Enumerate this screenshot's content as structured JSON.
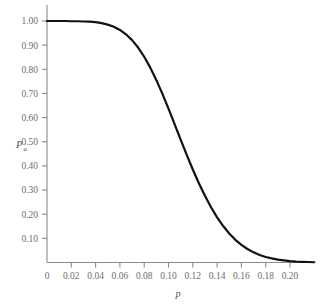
{
  "chart_data": {
    "type": "line",
    "title": "",
    "subtitle": "",
    "xlabel": "p",
    "ylabel": "Pa",
    "ylabel_main": "P",
    "ylabel_sub": "a",
    "xlim": [
      0,
      0.22
    ],
    "ylim": [
      0,
      1.0
    ],
    "grid": false,
    "legend": null,
    "x_ticks": [
      0,
      0.02,
      0.04,
      0.06,
      0.08,
      0.1,
      0.12,
      0.14,
      0.16,
      0.18,
      0.2
    ],
    "x_tick_labels": [
      "0",
      "0.02",
      "0.04",
      "0.06",
      "0.08",
      "0.10",
      "0.12",
      "0.14",
      "0.16",
      "0.18",
      "0.20"
    ],
    "y_ticks": [
      0.1,
      0.2,
      0.3,
      0.4,
      0.5,
      0.6,
      0.7,
      0.8,
      0.9,
      1.0
    ],
    "y_tick_labels": [
      "0.10",
      "0.20",
      "0.30",
      "0.40",
      "0.50",
      "0.60",
      "0.70",
      "0.80",
      "0.90",
      "1.00"
    ],
    "series": [
      {
        "name": "Probability of acceptance",
        "color": "#111111",
        "x": [
          0.0,
          0.005,
          0.01,
          0.015,
          0.02,
          0.025,
          0.03,
          0.035,
          0.04,
          0.045,
          0.05,
          0.055,
          0.06,
          0.065,
          0.07,
          0.075,
          0.08,
          0.085,
          0.09,
          0.095,
          0.1,
          0.105,
          0.11,
          0.115,
          0.12,
          0.125,
          0.13,
          0.135,
          0.14,
          0.145,
          0.15,
          0.155,
          0.16,
          0.165,
          0.17,
          0.175,
          0.18,
          0.185,
          0.19,
          0.195,
          0.2,
          0.205,
          0.21,
          0.215,
          0.22
        ],
        "y": [
          1.0,
          1.0,
          1.0,
          1.0,
          0.999,
          0.999,
          0.998,
          0.997,
          0.995,
          0.991,
          0.985,
          0.976,
          0.963,
          0.945,
          0.921,
          0.89,
          0.852,
          0.807,
          0.755,
          0.698,
          0.637,
          0.573,
          0.509,
          0.446,
          0.385,
          0.328,
          0.276,
          0.229,
          0.187,
          0.151,
          0.12,
          0.094,
          0.073,
          0.056,
          0.042,
          0.031,
          0.023,
          0.017,
          0.012,
          0.009,
          0.006,
          0.004,
          0.003,
          0.002,
          0.001
        ]
      }
    ]
  },
  "axes": {
    "y_axis_name": "probability-of-acceptance-axis",
    "x_axis_name": "fraction-defective-axis"
  }
}
